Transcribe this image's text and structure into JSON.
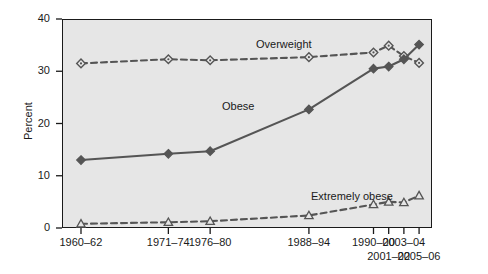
{
  "chart_data": {
    "type": "line",
    "title": "",
    "xlabel": "",
    "ylabel": "Percent",
    "ylim": [
      0,
      40
    ],
    "yticks": [
      0,
      10,
      20,
      30,
      40
    ],
    "grid": false,
    "legend_position": "inline-annotations",
    "categories": [
      "1960–62",
      "1971–74",
      "1976–80",
      "1988–94",
      "1990–00",
      "2001–02",
      "2003–04",
      "2005–06"
    ],
    "x_positions": [
      1961,
      1972.5,
      1978,
      1991,
      1999.5,
      2001.5,
      2003.5,
      2005.5
    ],
    "series": [
      {
        "name": "Overweight",
        "marker": "diamond",
        "line_style": "dashed",
        "color": "#555555",
        "values": [
          31.5,
          32.3,
          32.1,
          32.7,
          33.6,
          34.9,
          32.9,
          31.6
        ]
      },
      {
        "name": "Obese",
        "marker": "diamond-filled",
        "line_style": "solid",
        "color": "#555555",
        "values": [
          13.0,
          14.2,
          14.7,
          22.7,
          30.5,
          30.9,
          32.3,
          35.1
        ]
      },
      {
        "name": "Extremely obese",
        "marker": "triangle",
        "line_style": "dashed",
        "color": "#555555",
        "values": [
          0.8,
          1.1,
          1.3,
          2.4,
          4.5,
          5.0,
          4.9,
          6.2
        ]
      }
    ],
    "annotations": [
      {
        "text": "Overweight",
        "x_px": 256,
        "y_px": 38
      },
      {
        "text": "Obese",
        "x_px": 222,
        "y_px": 100
      },
      {
        "text": "Extremely obese",
        "x_px": 311,
        "y_px": 190
      }
    ]
  }
}
